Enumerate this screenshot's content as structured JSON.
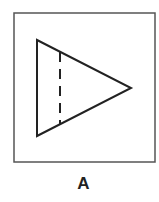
{
  "figure": {
    "label": "A",
    "shapes": {
      "frame": {
        "type": "square",
        "x": 14,
        "y": 13,
        "width": 141,
        "height": 149
      },
      "triangle": {
        "type": "triangle",
        "points": [
          [
            37,
            40
          ],
          [
            131,
            88
          ],
          [
            37,
            136
          ]
        ],
        "pointing": "right"
      },
      "dashed_line": {
        "type": "dashed-vertical-line",
        "x": 60,
        "y1": 51,
        "y2": 124
      }
    },
    "colors": {
      "stroke": "#222222",
      "frame": "#555555",
      "background": "#ffffff"
    }
  }
}
